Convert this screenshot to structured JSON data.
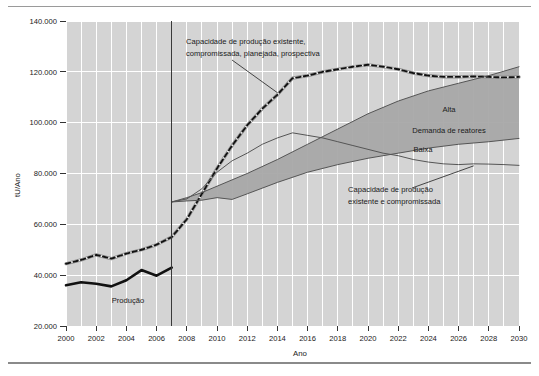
{
  "figure": {
    "name": "uranium-production-capacity-demand-chart"
  },
  "chart_data": {
    "type": "line",
    "title": "",
    "subtitle": "",
    "xlabel": "Ano",
    "ylabel": "tU/Ano",
    "xlim": [
      2000,
      2030
    ],
    "ylim": [
      20000,
      140000
    ],
    "grid": true,
    "legend_position": "inline-annotations",
    "x_ticks": [
      2000,
      2002,
      2004,
      2006,
      2008,
      2010,
      2012,
      2014,
      2016,
      2018,
      2020,
      2022,
      2024,
      2026,
      2028,
      2030
    ],
    "x_tick_labels": [
      "2000",
      "2002",
      "2004",
      "2006",
      "2008",
      "2010",
      "2012",
      "2014",
      "2016",
      "2018",
      "2020",
      "2022",
      "2024",
      "2026",
      "2028",
      "2030"
    ],
    "y_ticks": [
      20000,
      40000,
      60000,
      80000,
      100000,
      120000,
      140000
    ],
    "y_tick_labels": [
      "20.000",
      "40.000",
      "60.000",
      "80.000",
      "100.000",
      "120.000",
      "140.000"
    ],
    "divider_year": 2007,
    "series": [
      {
        "name": "Produção",
        "style": "thick-solid-black",
        "color": "#111111",
        "x": [
          2000,
          2001,
          2002,
          2003,
          2004,
          2005,
          2006,
          2007
        ],
        "values": [
          36000,
          37200,
          36600,
          35600,
          38000,
          42000,
          39800,
          43000
        ]
      },
      {
        "name": "Capacidade de produção existente, compromissada, planejada, prospectiva",
        "style": "dashed-black-on-gray",
        "color": "#111111",
        "x": [
          2000,
          2001,
          2002,
          2003,
          2004,
          2005,
          2006,
          2007,
          2008,
          2009,
          2010,
          2011,
          2012,
          2013,
          2014,
          2015,
          2016,
          2017,
          2018,
          2019,
          2020,
          2021,
          2022,
          2023,
          2024,
          2025,
          2026,
          2027,
          2028,
          2029,
          2030
        ],
        "values": [
          44500,
          46000,
          48000,
          46500,
          48500,
          50000,
          52000,
          55000,
          62000,
          72000,
          82000,
          91000,
          99000,
          105500,
          111000,
          117500,
          118500,
          120000,
          121000,
          122000,
          122800,
          122000,
          121000,
          119500,
          118500,
          118000,
          118000,
          118200,
          118000,
          117800,
          118000
        ]
      },
      {
        "name": "Capacidade de produção existente e compromissada",
        "style": "thin-solid-gray",
        "color": "#555555",
        "x": [
          2007,
          2008,
          2009,
          2010,
          2011,
          2012,
          2013,
          2014,
          2015,
          2016,
          2017,
          2018,
          2019,
          2020,
          2021,
          2022,
          2023,
          2024,
          2025,
          2026,
          2027,
          2028,
          2029,
          2030
        ],
        "values": [
          68800,
          70000,
          74000,
          80500,
          85000,
          88000,
          91500,
          94000,
          96000,
          95000,
          94000,
          92500,
          91000,
          89500,
          88000,
          87000,
          85500,
          84500,
          83800,
          83500,
          83800,
          83700,
          83500,
          83200
        ]
      },
      {
        "name": "Demanda de reatores — Alta",
        "style": "thin-solid-gray",
        "color": "#555555",
        "x": [
          2007,
          2008,
          2009,
          2010,
          2012,
          2014,
          2016,
          2018,
          2020,
          2022,
          2024,
          2026,
          2028,
          2030
        ],
        "values": [
          68800,
          70500,
          72500,
          75000,
          80000,
          85500,
          91500,
          97500,
          103500,
          108500,
          112500,
          115500,
          118500,
          122000
        ]
      },
      {
        "name": "Demanda de reatores — Baixa",
        "style": "thin-solid-gray",
        "color": "#555555",
        "x": [
          2007,
          2008,
          2009,
          2010,
          2011,
          2012,
          2014,
          2016,
          2018,
          2020,
          2022,
          2024,
          2026,
          2028,
          2030
        ],
        "values": [
          68800,
          69200,
          69500,
          70500,
          69800,
          72000,
          76500,
          80500,
          83500,
          86000,
          88000,
          90000,
          91500,
          92500,
          93800
        ]
      }
    ],
    "band": {
      "name": "Faixa de demanda de reatores",
      "between": [
        "Demanda de reatores — Alta",
        "Demanda de reatores — Baixa"
      ],
      "color": "#a8a8a8"
    },
    "annotations": [
      {
        "id": "annot-capacidade-prospectiva",
        "lines": [
          "Capacidade de produção existente,",
          "compromissada, planejada, prospectiva"
        ],
        "leader_to_year": 2014
      },
      {
        "id": "annot-capacidade-existente",
        "lines": [
          "Capacidade de produção",
          "existente e compromissada"
        ],
        "leader_to_year": 2027
      }
    ],
    "inline_labels": [
      {
        "id": "label-alta",
        "text": "Alta"
      },
      {
        "id": "label-demanda",
        "text": "Demanda de reatores"
      },
      {
        "id": "label-baixa",
        "text": "Baixa"
      },
      {
        "id": "label-producao",
        "text": "Produção"
      }
    ]
  },
  "axes": {
    "y_title": "tU/Ano",
    "x_title": "Ano",
    "y_labels": {
      "t140": "140.000",
      "t120": "120.000",
      "t100": "100.000",
      "t80": "80.000",
      "t60": "60.000",
      "t40": "40.000",
      "t20": "20.000"
    },
    "x_labels": {
      "y2000": "2000",
      "y2002": "2002",
      "y2004": "2004",
      "y2006": "2006",
      "y2008": "2008",
      "y2010": "2010",
      "y2012": "2012",
      "y2014": "2014",
      "y2016": "2016",
      "y2018": "2018",
      "y2020": "2020",
      "y2022": "2022",
      "y2024": "2024",
      "y2026": "2026",
      "y2028": "2028",
      "y2030": "2030"
    }
  },
  "labels": {
    "annot1_line1": "Capacidade de produção existente,",
    "annot1_line2": "compromissada, planejada, prospectiva",
    "annot2_line1": "Capacidade de produção",
    "annot2_line2": "existente e compromissada",
    "alta": "Alta",
    "demanda": "Demanda de reatores",
    "baixa": "Baixa",
    "producao": "Produção"
  },
  "colors": {
    "plot_background": "#d4d4d4",
    "gridline": "#ffffff",
    "band_fill": "#a8a8a8",
    "line_dark": "#111111",
    "line_gray": "#555555",
    "divider": "#3a3a3a",
    "rule": "#9a9a9a"
  }
}
